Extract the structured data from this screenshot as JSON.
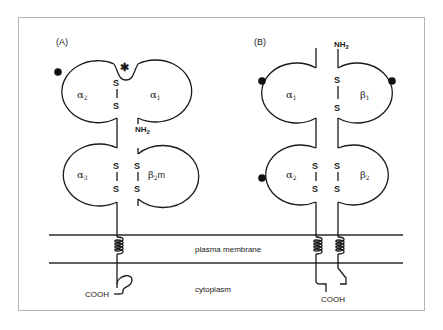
{
  "figure": {
    "panels": [
      {
        "id": "A",
        "label": "(A)",
        "domains": [
          {
            "name": "alpha2",
            "greek": "α",
            "sub": "2",
            "suffix": ""
          },
          {
            "name": "alpha1",
            "greek": "α",
            "sub": "1",
            "suffix": ""
          },
          {
            "name": "alpha3",
            "greek": "α",
            "sub": "3",
            "suffix": ""
          },
          {
            "name": "beta2m",
            "greek": "β",
            "sub": "2",
            "suffix": "m"
          }
        ],
        "disulfide_label": "S",
        "n_terminus": {
          "main": "NH",
          "sub": "2"
        },
        "c_terminus": "COOH",
        "asterisk": "✱"
      },
      {
        "id": "B",
        "label": "(B)",
        "domains": [
          {
            "name": "alpha1",
            "greek": "α",
            "sub": "1",
            "suffix": ""
          },
          {
            "name": "beta1",
            "greek": "β",
            "sub": "1",
            "suffix": ""
          },
          {
            "name": "alpha2",
            "greek": "α",
            "sub": "2",
            "suffix": ""
          },
          {
            "name": "beta2",
            "greek": "β",
            "sub": "2",
            "suffix": ""
          }
        ],
        "disulfide_label": "S",
        "n_terminus": {
          "main": "NH",
          "sub": "2"
        },
        "c_terminus": "COOH"
      }
    ],
    "membrane_label": "plasma membrane",
    "cytoplasm_label": "cytoplasm",
    "colors": {
      "line": "#1a1a1a",
      "frame": "#b5b5b5",
      "background": "#ffffff"
    }
  }
}
